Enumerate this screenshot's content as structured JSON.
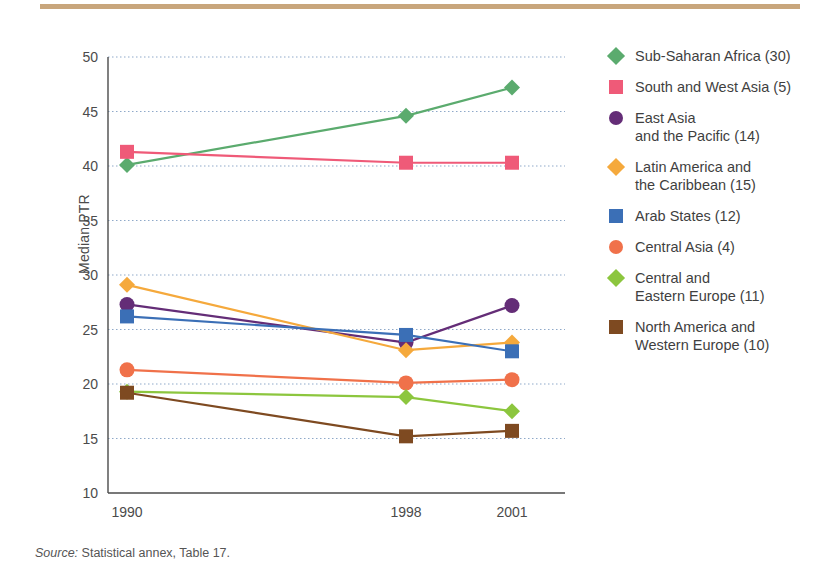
{
  "figure": {
    "source_prefix": "Source:",
    "source_text": " Statistical annex, Table 17."
  },
  "axis": {
    "y_title": "Median PTR",
    "y_ticks": [
      "50",
      "45",
      "40",
      "35",
      "30",
      "25",
      "20",
      "15",
      "10"
    ],
    "x_ticks": [
      "1990",
      "1998",
      "2001"
    ]
  },
  "legend": {
    "items": [
      {
        "label": "Sub-Saharan Africa (30)",
        "color": "#5bab6e",
        "marker": "diamond"
      },
      {
        "label": "South and West Asia (5)",
        "color": "#ef5a78",
        "marker": "square"
      },
      {
        "label": "East Asia\nand the Pacific (14)",
        "color": "#642d77",
        "marker": "circle"
      },
      {
        "label": "Latin America and\nthe Caribbean (15)",
        "color": "#f5a93c",
        "marker": "diamond"
      },
      {
        "label": "Arab States (12)",
        "color": "#3b6fb6",
        "marker": "square"
      },
      {
        "label": "Central Asia (4)",
        "color": "#f0714a",
        "marker": "circle"
      },
      {
        "label": "Central and\nEastern Europe (11)",
        "color": "#8cc63e",
        "marker": "diamond"
      },
      {
        "label": "North America and\nWestern Europe (10)",
        "color": "#7e4a21",
        "marker": "square"
      }
    ]
  },
  "chart_data": {
    "type": "line",
    "title": "",
    "xlabel": "",
    "ylabel": "Median PTR",
    "x": [
      "1990",
      "1998",
      "2001"
    ],
    "ylim": [
      10,
      50
    ],
    "ytick_step": 5,
    "grid": "horizontal-dotted",
    "legend_position": "right",
    "series": [
      {
        "name": "Sub-Saharan Africa (30)",
        "color": "#5bab6e",
        "marker": "diamond",
        "values": [
          40.1,
          44.6,
          47.2
        ]
      },
      {
        "name": "South and West Asia (5)",
        "color": "#ef5a78",
        "marker": "square",
        "values": [
          41.3,
          40.3,
          40.3
        ]
      },
      {
        "name": "East Asia and the Pacific (14)",
        "color": "#642d77",
        "marker": "circle",
        "values": [
          27.3,
          23.8,
          27.2
        ]
      },
      {
        "name": "Latin America and the Caribbean (15)",
        "color": "#f5a93c",
        "marker": "diamond",
        "values": [
          29.1,
          23.1,
          23.8
        ]
      },
      {
        "name": "Arab States (12)",
        "color": "#3b6fb6",
        "marker": "square",
        "values": [
          26.2,
          24.5,
          23.0
        ]
      },
      {
        "name": "Central Asia (4)",
        "color": "#f0714a",
        "marker": "circle",
        "values": [
          21.3,
          20.1,
          20.4
        ]
      },
      {
        "name": "Central and Eastern Europe (11)",
        "color": "#8cc63e",
        "marker": "diamond",
        "values": [
          19.3,
          18.8,
          17.5
        ]
      },
      {
        "name": "North America and Western Europe (10)",
        "color": "#7e4a21",
        "marker": "square",
        "values": [
          19.2,
          15.2,
          15.7
        ]
      }
    ]
  }
}
